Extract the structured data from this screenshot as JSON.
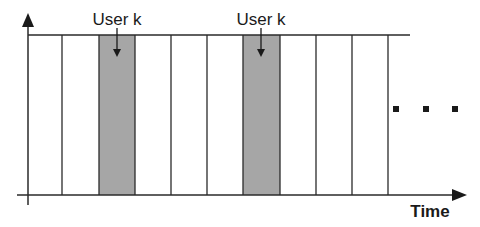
{
  "diagram": {
    "type": "tdma-time-slots",
    "slot_count": 11,
    "highlighted_slots": [
      3,
      7
    ],
    "highlight_color": "#a6a6a6",
    "line_color": "#2a2a2a",
    "user_labels": [
      "User k",
      "User k"
    ],
    "x_axis_label": "Time",
    "continuation": "..."
  }
}
